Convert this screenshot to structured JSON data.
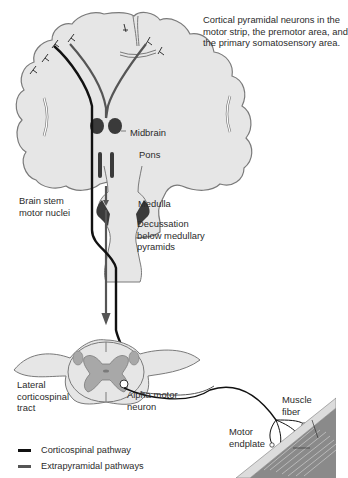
{
  "labels": {
    "cortical": [
      "Cortical pyramidal neurons in the",
      "motor strip, the premotor area, and",
      "the primary somatosensory area."
    ],
    "midbrain": "Midbrain",
    "pons": "Pons",
    "brainstem_nuclei": [
      "Brain stem",
      "motor nuclei"
    ],
    "medulla": "Medulla",
    "decussation": [
      "Decussation",
      "below medullary",
      "pyramids"
    ],
    "lateral_tract": [
      "Lateral",
      "corticospinal",
      "tract"
    ],
    "alpha_motor": [
      "Alpha motor",
      "neuron"
    ],
    "muscle_fiber": [
      "Muscle",
      "fiber"
    ],
    "motor_endplate": [
      "Motor",
      "endplate"
    ]
  },
  "legend": [
    {
      "label": "Corticospinal pathway",
      "color": "#111111"
    },
    {
      "label": "Extrapyramidal pathways",
      "color": "#555555"
    }
  ],
  "colors": {
    "tissue": "#e6e6e6",
    "outline": "#7a7a7a",
    "gray_matter": "#a8a8a8",
    "nuclei": "#3a3a3a",
    "corticospinal": "#111111",
    "extrapyramidal": "#555555",
    "muscle": "#8a8a8a"
  }
}
